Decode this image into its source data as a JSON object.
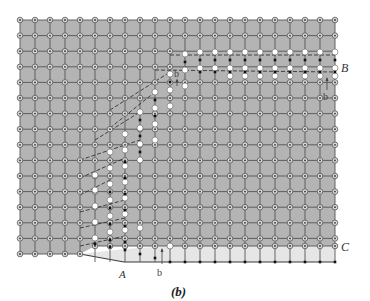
{
  "figure": {
    "caption": "(b)",
    "colors": {
      "background": "#ffffff",
      "crystal_fill": "#b4b4b4",
      "slipped_fill": "#e6e6e6",
      "grid_line": "#555555",
      "atom_ring": "#555555",
      "atom_center": "#333333",
      "upper_atom": "#ffffff",
      "lower_atom": "#111111"
    },
    "grid": {
      "x0": 20,
      "dx": 15,
      "cols": 22,
      "y0": 20,
      "dy": 15.6,
      "rows": 16
    },
    "labels": {
      "A": "A",
      "B": "B",
      "C": "C",
      "b_top": "b",
      "b_right": "b",
      "b_bottom": "b"
    },
    "dislocation_line": [
      [
        80,
        254
      ],
      [
        124,
        262
      ],
      [
        170,
        246
      ],
      [
        335,
        246
      ]
    ],
    "dislocation_path_upper": [
      [
        95,
        238
      ],
      [
        95,
        175
      ],
      [
        110,
        140
      ],
      [
        125,
        112
      ],
      [
        140,
        97
      ],
      [
        170,
        82
      ],
      [
        185,
        68
      ],
      [
        335,
        68
      ]
    ]
  }
}
